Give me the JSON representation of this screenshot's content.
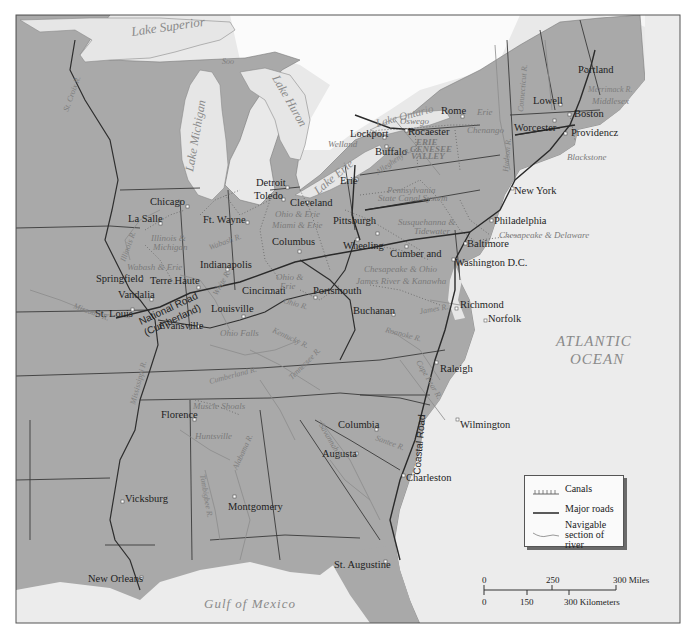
{
  "map": {
    "colors": {
      "land": "#a9a9a9",
      "water": "#e9e9e9",
      "lakes": "#e6e6e6",
      "foreign_land": "#ffffff",
      "borders": "#3a3a3a",
      "roads": "#2a2a2a",
      "canals": "#6b6b6b",
      "rivers": "#8c8c8c",
      "frame": "#555555"
    },
    "water_bodies": {
      "lake_superior": "Lake Superior",
      "lake_michigan": "Lake Michigan",
      "lake_huron": "Lake Huron",
      "lake_erie": "Lake Erie",
      "lake_ontario": "Lake Ontario",
      "atlantic_line1": "ATLANTIC",
      "atlantic_line2": "OCEAN",
      "gulf": "Gulf of Mexico"
    },
    "cities": {
      "soo": "Soo",
      "portland": "Portland",
      "lowell": "Lowell",
      "boston": "Boston",
      "worcester": "Worcester",
      "providence": "Providencz",
      "rome": "Rome",
      "rochester": "Rocaester",
      "lockport": "Lockport",
      "buffalo": "Buffalo",
      "erie": "Erie",
      "detroit": "Detroit",
      "toledo": "Toledo",
      "cleveland": "Cleveland",
      "chicago": "Chicago",
      "la_salle": "La Salle",
      "ft_wayne": "Ft. Wayne",
      "columbus": "Columbus",
      "pittsburgh": "Pittsburgh",
      "wheeling": "Wheeling",
      "cumberland": "Cumber and",
      "new_york": "New York",
      "philadelphia": "Philadelphia",
      "baltimore": "Baltimore",
      "washington": "Washington D.C.",
      "indianapolis": "Indianapolis",
      "springfield": "Springfield",
      "terre_haute": "Terre Haute",
      "vandalia": "Vandalia",
      "st_louis": "St. Louis",
      "cincinnati": "Cincinnati",
      "portsmouth": "Portsmouth",
      "louisville": "Louisville",
      "evansville": "Evansville",
      "buchanan": "Buchanan",
      "richmond": "Richmond",
      "norfolk": "Norfolk",
      "raleigh": "Raleigh",
      "florence": "Florence",
      "columbia": "Columbia",
      "augusta": "Augusta",
      "wilmington": "Wilmington",
      "charleston": "Charleston",
      "vicksburg": "Vicksburg",
      "montgomery": "Montgomery",
      "new_orleans": "New Orleans",
      "st_augustine": "St. Augustine"
    },
    "canals": {
      "erie": "Erie",
      "oswego": "Oswego",
      "chenango": "Chenango",
      "welland": "Welland",
      "erie_genesee_1": "ERIE",
      "erie_genesee_2": "GENESEE",
      "erie_genesee_3": "VALLEY",
      "pennsylvania_1": "Pennsylvania",
      "pennsylvania_2": "State Canal System",
      "ohio_erie_north": "Ohio & Erie",
      "miami_erie": "Miami & Erie",
      "susquehanna_1": "Susquehanna &",
      "susquehanna_2": "Tidewater",
      "chesapeake_delaware": "Chesapeake & Delaware",
      "chesapeake_ohio": "Chesapeake & Ohio",
      "james_kanawha": "James River & Kanawha",
      "illinois_michigan_1": "Illinois &",
      "illinois_michigan_2": "Michigan",
      "wabash_erie": "Wabash & Erie",
      "ohio_erie_south_1": "Ohio &",
      "ohio_erie_south_2": "Erie",
      "ohio_falls": "Ohio Falls",
      "muscle_shoals": "Muscle Shoals",
      "huntsville": "Huntsville",
      "middlesex": "Middlesex",
      "blackstone": "Blackstone",
      "morris": "Morris"
    },
    "rivers": {
      "st_croix": "St. Croix R.",
      "connecticut": "Connecticut R.",
      "hudson": "Hudson R.",
      "merrimack": "Merrimack R.",
      "illinois": "Illinois R.",
      "wabash": "Wabash R.",
      "white": "White R.",
      "ohio": "Ohio R.",
      "missouri": "Missouri R.",
      "kentucky": "Kentucky R.",
      "james": "James R.",
      "roanoke": "Roanoke R.",
      "cumberland": "Cumberland R.",
      "tennessee": "Tennessee R.",
      "mississippi": "Mississippi R.",
      "cape_fear": "Cape Fear R.",
      "alabama": "Alabama R.",
      "tombigbee": "Tombigbee R.",
      "savannah": "Savannah R.",
      "santee": "Santee R.",
      "allegheny": "Allegheny R."
    },
    "roads": {
      "national_1": "National Road",
      "national_2": "(Cumberland)",
      "coastal": "Coastal Road"
    }
  },
  "legend": {
    "canals": "Canals",
    "roads": "Major roads",
    "river_1": "Navigable",
    "river_2": "section of river"
  },
  "scale": {
    "miles_0": "0",
    "miles_250": "250",
    "miles_300": "300 Miles",
    "km_0": "0",
    "km_150": "150",
    "km_300": "300 Kilometers"
  }
}
